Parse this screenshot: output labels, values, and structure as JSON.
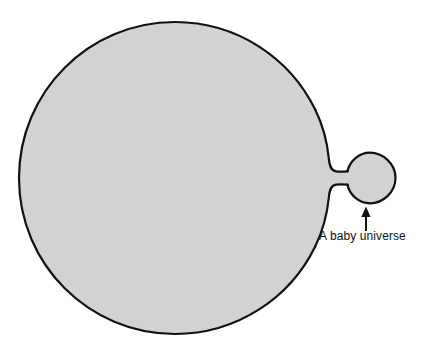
{
  "figure": {
    "background_color": "#ffffff"
  },
  "shapes": {
    "parent_universe": {
      "name": "parent-universe",
      "shape": "circle",
      "center_x": 175,
      "center_y": 178,
      "radius": 156,
      "fill_color": "#d2d2d2",
      "stroke_color": "#111111",
      "stroke_width": 2.2
    },
    "neck": {
      "name": "wormhole-neck",
      "shape": "throat",
      "waist_x": 334,
      "waist_y": 178,
      "waist_height": 13,
      "fill_color": "#d2d2d2",
      "stroke_color": "#111111",
      "stroke_width": 2.2
    },
    "baby_universe": {
      "name": "baby-universe",
      "shape": "circle",
      "center_x": 370,
      "center_y": 178,
      "radius": 26,
      "fill_color": "#d2d2d2",
      "stroke_color": "#111111",
      "stroke_width": 2.2
    }
  },
  "annotation": {
    "label": "A baby universe",
    "text_color": "#121212",
    "arrow": {
      "name": "annotation-arrow",
      "tail_x": 366,
      "tail_y": 231,
      "head_x": 366,
      "head_y": 207,
      "direction": "up",
      "color": "#111111",
      "stroke_width": 2
    }
  }
}
